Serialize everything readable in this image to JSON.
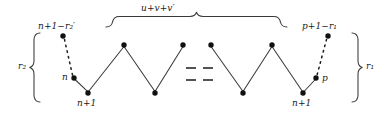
{
  "figure": {
    "type": "zigzag-lattice-path-diagram",
    "background": "#ffffff",
    "stroke_color": "#3a3a3a",
    "dot_color": "#111111",
    "labels": {
      "top_brace": {
        "base": "u",
        "plus1": "+",
        "v": "v",
        "plus2": "+",
        "vprime": "v",
        "prime": "′",
        "full": "u+v+v′"
      },
      "left_brace": {
        "base": "r",
        "sub": "2",
        "full": "r₂"
      },
      "right_brace": {
        "base": "r",
        "sub": "1",
        "full": "r₁"
      },
      "top_left_node": {
        "full": "n+1−r₂′",
        "lead": "n",
        "op1": "+1−",
        "sym": "r",
        "sub": "2",
        "prime": "′"
      },
      "top_right_node": {
        "full": "p+1−r₁",
        "lead": "p",
        "op1": "+1−",
        "sym": "r",
        "sub": "1"
      },
      "left_mid_node": "n",
      "left_bottom_node": {
        "full": "n+1",
        "lead": "n",
        "op": "+1"
      },
      "right_mid_node": "p",
      "right_bottom_node": {
        "full": "n+1",
        "lead": "n",
        "op": "+1"
      }
    },
    "ellipsis_dashes": [
      "—",
      "—",
      "—",
      "—"
    ],
    "nodes": [
      {
        "name": "top-left-outer-node",
        "x": 63,
        "y": 36
      },
      {
        "name": "left-mid-node",
        "x": 74,
        "y": 78
      },
      {
        "name": "left-bottom-node",
        "x": 88,
        "y": 93
      },
      {
        "name": "peak-node-1",
        "x": 124,
        "y": 45
      },
      {
        "name": "valley-node-1",
        "x": 155,
        "y": 93
      },
      {
        "name": "peak-node-2",
        "x": 183,
        "y": 45
      },
      {
        "name": "peak-node-3",
        "x": 211,
        "y": 45
      },
      {
        "name": "valley-node-2",
        "x": 243,
        "y": 93
      },
      {
        "name": "peak-node-4",
        "x": 272,
        "y": 45
      },
      {
        "name": "right-bottom-node",
        "x": 303,
        "y": 93
      },
      {
        "name": "right-mid-node",
        "x": 316,
        "y": 78
      },
      {
        "name": "top-right-outer-node",
        "x": 328,
        "y": 36
      }
    ]
  }
}
